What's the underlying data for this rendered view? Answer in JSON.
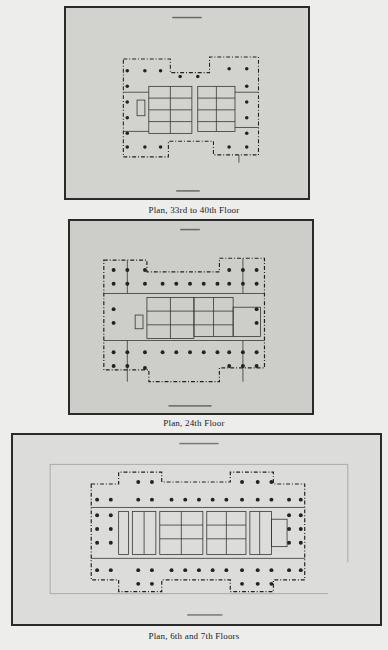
{
  "page": {
    "plates": [
      {
        "id": "plan-33-40",
        "caption": "Plan, 33rd to 40th Floor"
      },
      {
        "id": "plan-24",
        "caption": "Plan, 24th Floor"
      },
      {
        "id": "plan-6-7",
        "caption": "Plan, 6th and 7th Floors"
      }
    ]
  }
}
